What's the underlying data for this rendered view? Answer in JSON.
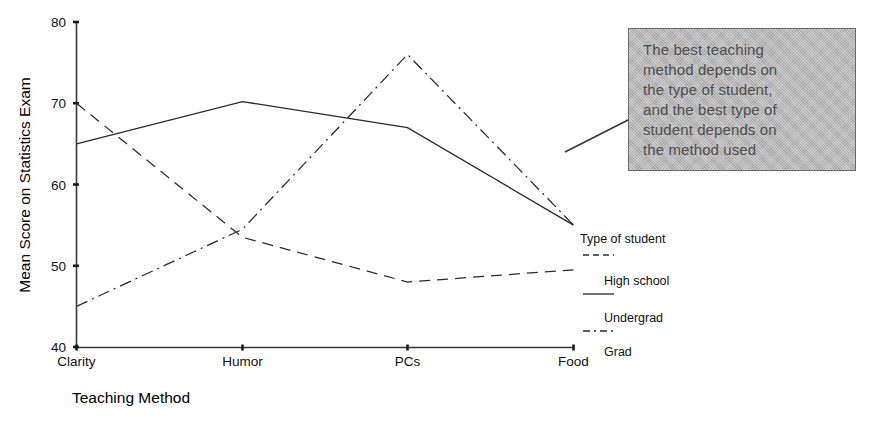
{
  "chart_data": {
    "type": "line",
    "title": "",
    "xlabel": "Teaching Method",
    "ylabel": "Mean Score on Statistics Exam",
    "categories": [
      "Clarity",
      "Humor",
      "PCs",
      "Food"
    ],
    "ylim": [
      40,
      80
    ],
    "yticks": [
      40,
      50,
      60,
      70,
      80
    ],
    "grid": false,
    "legend_position": "right",
    "legend_title": "Type of student",
    "series": [
      {
        "name": "High school",
        "style": "dashed",
        "values": [
          70,
          53.5,
          48,
          49.5
        ]
      },
      {
        "name": "Undergrad",
        "style": "solid",
        "values": [
          65,
          70.2,
          67,
          55
        ]
      },
      {
        "name": "Grad",
        "style": "dashdot",
        "values": [
          45,
          54.5,
          76,
          55
        ]
      }
    ],
    "annotation": {
      "text": "The best teaching\nmethod depends on\nthe type of student,\nand the best type of\nstudent depends on\nthe method used",
      "box_fill": "#b9b9b9",
      "box_border": "#6a6a6a",
      "text_color": "#4f4f4f",
      "points_to_series": "Undergrad"
    }
  },
  "axes": {
    "y_tick_labels": [
      "80",
      "70",
      "60",
      "50",
      "40"
    ],
    "x_tick_labels": [
      "Clarity",
      "Humor",
      "PCs",
      "Food"
    ],
    "y_title": "Mean Score on Statistics Exam",
    "x_title": "Teaching Method",
    "axis_color": "#3a3a3a"
  },
  "legend": {
    "title": "Type of student",
    "entries": [
      {
        "label": "High school",
        "style": "dashed"
      },
      {
        "label": "Undergrad",
        "style": "solid"
      },
      {
        "label": "Grad",
        "style": "dashdot"
      }
    ]
  }
}
